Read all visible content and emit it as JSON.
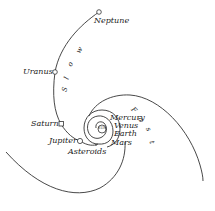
{
  "diagram": {
    "sun_label": "SUN",
    "planets": [
      {
        "name": "Neptune"
      },
      {
        "name": "Uranus"
      },
      {
        "name": "Saturn"
      },
      {
        "name": "Jupiter"
      },
      {
        "name": "Asteroids"
      },
      {
        "name": "Mercury"
      },
      {
        "name": "Venus"
      },
      {
        "name": "Earth"
      },
      {
        "name": "Mars"
      }
    ],
    "slow_letters": [
      "S",
      "l",
      "o",
      "w"
    ],
    "fast_letters": [
      "F",
      "a",
      "s",
      "t"
    ],
    "colors": {
      "line": "#333333",
      "text": "#222222",
      "background": "#ffffff"
    }
  }
}
